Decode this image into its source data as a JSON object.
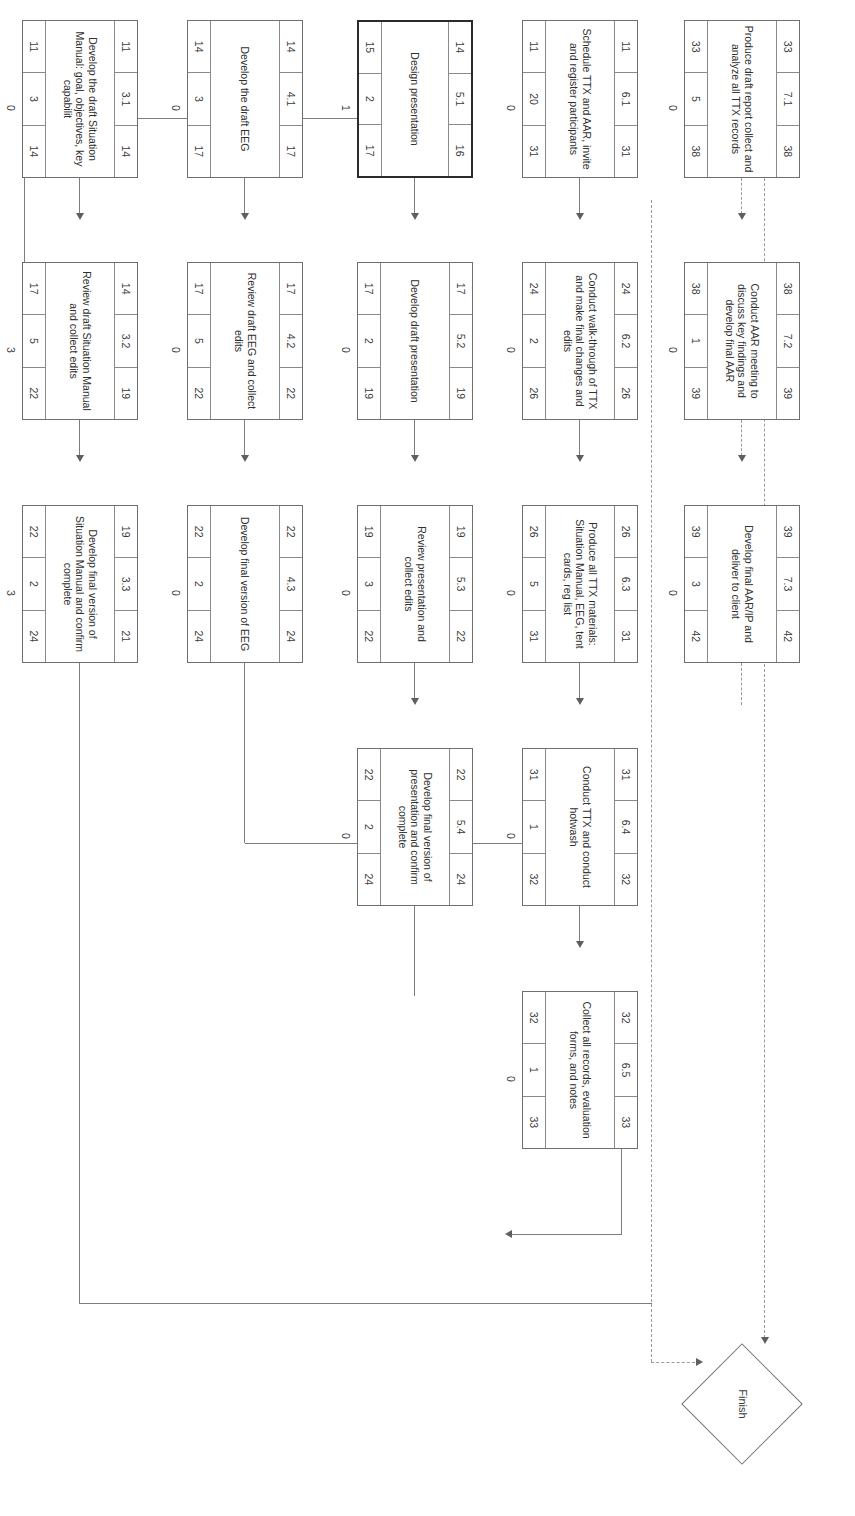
{
  "diagram": {
    "orientation": "rotated-90",
    "node_legend": {
      "top_left": "early start",
      "top_center": "activity id",
      "top_right": "early finish",
      "center": "activity description",
      "bottom_left": "late start",
      "bottom_center": "duration",
      "bottom_right": "late finish",
      "outside": "float / slack"
    },
    "milestone": {
      "label": "Finish"
    },
    "nodes": [
      {
        "id": "3.1",
        "early_start": "11",
        "early_finish": "14",
        "description": "Develop the draft Situation Manual: goal, objectives, key capabilit",
        "late_start": "11",
        "duration": "3",
        "late_finish": "14",
        "float": "0",
        "critical": false
      },
      {
        "id": "3.2",
        "early_start": "14",
        "early_finish": "19",
        "description": "Review draft Situation Manual and collect edits",
        "late_start": "17",
        "duration": "5",
        "late_finish": "22",
        "float": "3",
        "critical": false
      },
      {
        "id": "3.3",
        "early_start": "19",
        "early_finish": "21",
        "description": "Develop final version of Situation Manual and confirm complete",
        "late_start": "22",
        "duration": "2",
        "late_finish": "24",
        "float": "3",
        "critical": false
      },
      {
        "id": "4.1",
        "early_start": "14",
        "early_finish": "17",
        "description": "Develop the draft EEG",
        "late_start": "14",
        "duration": "3",
        "late_finish": "17",
        "float": "0",
        "critical": false
      },
      {
        "id": "4.2",
        "early_start": "17",
        "early_finish": "22",
        "description": "Review draft EEG and collect edits",
        "late_start": "17",
        "duration": "5",
        "late_finish": "22",
        "float": "0",
        "critical": false
      },
      {
        "id": "4.3",
        "early_start": "22",
        "early_finish": "24",
        "description": "Develop final version of EEG",
        "late_start": "22",
        "duration": "2",
        "late_finish": "24",
        "float": "0",
        "critical": false
      },
      {
        "id": "5.1",
        "early_start": "14",
        "early_finish": "16",
        "description": "Design presentation",
        "late_start": "15",
        "duration": "2",
        "late_finish": "17",
        "float": "1",
        "critical": true
      },
      {
        "id": "5.2",
        "early_start": "17",
        "early_finish": "19",
        "description": "Develop draft presentation",
        "late_start": "17",
        "duration": "2",
        "late_finish": "19",
        "float": "0",
        "critical": false
      },
      {
        "id": "5.3",
        "early_start": "19",
        "early_finish": "22",
        "description": "Review presentation and collect edits",
        "late_start": "19",
        "duration": "3",
        "late_finish": "22",
        "float": "0",
        "critical": false
      },
      {
        "id": "5.4",
        "early_start": "22",
        "early_finish": "24",
        "description": "Develop final version of presentation and confirm complete",
        "late_start": "22",
        "duration": "2",
        "late_finish": "24",
        "float": "0",
        "critical": false
      },
      {
        "id": "6.1",
        "early_start": "11",
        "early_finish": "31",
        "description": "Schedule TTX and AAR, invite and register participants",
        "late_start": "11",
        "duration": "20",
        "late_finish": "31",
        "float": "0",
        "critical": false
      },
      {
        "id": "6.2",
        "early_start": "24",
        "early_finish": "26",
        "description": "Conduct walk-through of TTX and make final changes and edits",
        "late_start": "24",
        "duration": "2",
        "late_finish": "26",
        "float": "0",
        "critical": false
      },
      {
        "id": "6.3",
        "early_start": "26",
        "early_finish": "31",
        "description": "Produce all TTX materials: Situation Manual, EEG, tent cards, reg list",
        "late_start": "26",
        "duration": "5",
        "late_finish": "31",
        "float": "0",
        "critical": false
      },
      {
        "id": "6.4",
        "early_start": "31",
        "early_finish": "32",
        "description": "Conduct TTX and conduct hotwash",
        "late_start": "31",
        "duration": "1",
        "late_finish": "32",
        "float": "0",
        "critical": false
      },
      {
        "id": "6.5",
        "early_start": "32",
        "early_finish": "33",
        "description": "Collect all records, evaluation forms, and notes",
        "late_start": "32",
        "duration": "1",
        "late_finish": "33",
        "float": "0",
        "critical": false
      },
      {
        "id": "7.1",
        "early_start": "33",
        "early_finish": "38",
        "description": "Produce draft report collect and analyze all TTX records",
        "late_start": "33",
        "duration": "5",
        "late_finish": "38",
        "float": "0",
        "critical": false
      },
      {
        "id": "7.2",
        "early_start": "38",
        "early_finish": "39",
        "description": "Conduct AAR meeting to discuss key findings and develop final AAR",
        "late_start": "38",
        "duration": "1",
        "late_finish": "39",
        "float": "0",
        "critical": false
      },
      {
        "id": "7.3",
        "early_start": "39",
        "early_finish": "42",
        "description": "Develop final AAR/IP and deliver to client",
        "late_start": "39",
        "duration": "3",
        "late_finish": "42",
        "float": "0",
        "critical": false
      }
    ]
  }
}
